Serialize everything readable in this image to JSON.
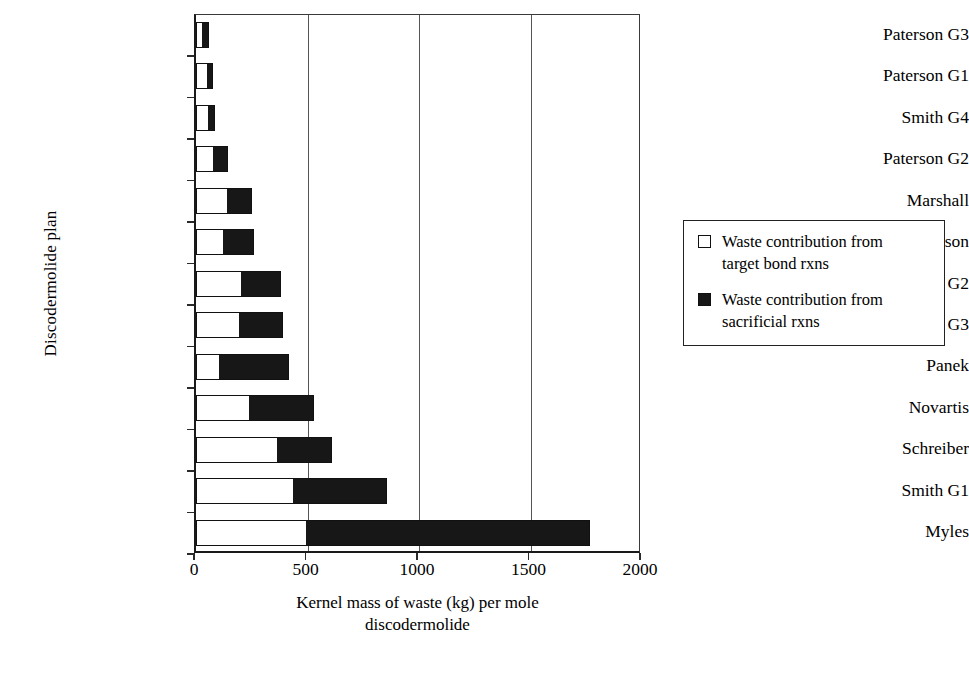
{
  "chart_data": {
    "type": "bar",
    "orientation": "horizontal",
    "stacked": true,
    "title": "",
    "xlabel": "Kernel mass of waste (kg) per mole discodermolide",
    "ylabel": "Discodermolide plan",
    "xlim": [
      0,
      2000
    ],
    "xticks": [
      0,
      500,
      1000,
      1500,
      2000
    ],
    "xtick_labels": [
      "0",
      "500",
      "1000",
      "1500",
      "2000"
    ],
    "grid": "vertical",
    "legend_position": "right",
    "categories": [
      "Paterson G3",
      "Paterson G1",
      "Smith G4",
      "Paterson G2",
      "Marshall",
      "Ardisson",
      "Smith G2",
      "Smith G3",
      "Panek",
      "Novartis",
      "Schreiber",
      "Smith G1",
      "Myles"
    ],
    "series": [
      {
        "name": "Waste contribution from target bond rxns",
        "color": "#ffffff",
        "values": [
          27,
          49,
          53,
          78,
          138,
          120,
          201,
          192,
          103,
          239,
          365,
          437,
          494
        ]
      },
      {
        "name": "Waste contribution from sacrificial rxns",
        "color": "#171717",
        "values": [
          32,
          27,
          32,
          65,
          112,
          139,
          179,
          196,
          312,
          292,
          243,
          419,
          1272
        ]
      }
    ],
    "totals": [
      59,
      76,
      85,
      143,
      250,
      259,
      380,
      388,
      415,
      531,
      608,
      856,
      1766
    ]
  },
  "axes": {
    "y_title": "Discodermolide plan",
    "x_title_line1": "Kernel mass of waste (kg) per mole",
    "x_title_line2": "discodermolide"
  },
  "legend": {
    "entries": [
      {
        "swatch": "open-square",
        "label": "Waste contribution from\ntarget bond rxns"
      },
      {
        "swatch": "filled-square",
        "label": "Waste contribution from\nsacrificial rxns"
      }
    ]
  },
  "colors": {
    "target_bond": "#ffffff",
    "sacrificial": "#171717",
    "outline": "#111111",
    "grid": "#555555",
    "background": "#ffffff"
  }
}
